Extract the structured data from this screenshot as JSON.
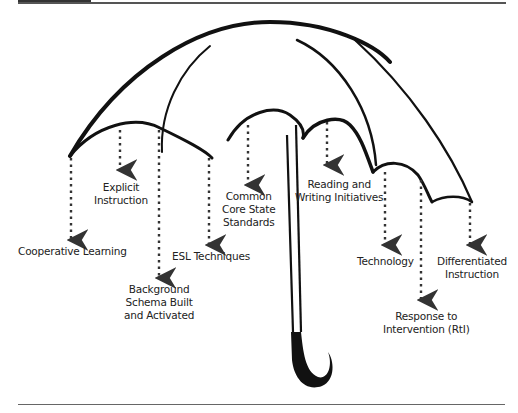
{
  "diagram": {
    "type": "umbrella-concept-diagram",
    "central_image": "umbrella",
    "labels": [
      {
        "id": "cooperative-learning",
        "lines": [
          "Cooperative Learning"
        ]
      },
      {
        "id": "explicit-instruction",
        "lines": [
          "Explicit",
          "Instruction"
        ]
      },
      {
        "id": "background-schema",
        "lines": [
          "Background",
          "Schema Built",
          "and Activated"
        ]
      },
      {
        "id": "esl-techniques",
        "lines": [
          "ESL Techniques"
        ]
      },
      {
        "id": "common-core",
        "lines": [
          "Common",
          "Core State",
          "Standards"
        ]
      },
      {
        "id": "reading-writing",
        "lines": [
          "Reading and",
          "Writing Initiatives"
        ]
      },
      {
        "id": "technology",
        "lines": [
          "Technology"
        ]
      },
      {
        "id": "rti",
        "lines": [
          "Response to",
          "Intervention (RtI)"
        ]
      },
      {
        "id": "differentiated-instruction",
        "lines": [
          "Differentiated",
          "Instruction"
        ]
      }
    ]
  },
  "colors": {
    "ink": "#111111",
    "text": "#222222",
    "rule": "#555555"
  }
}
